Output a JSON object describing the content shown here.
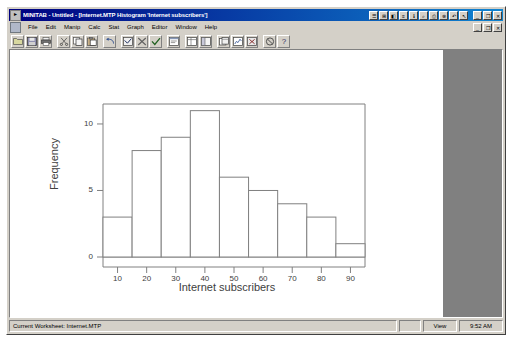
{
  "window": {
    "title": "MINITAB - Untitled - [Internet.MTP  Histogram 'Internet subscribers']",
    "app_icon": "minitab-icon",
    "control_minimize": "_",
    "control_restore": "❐",
    "control_close": "✕"
  },
  "menubar": {
    "doc_icon": "document-icon",
    "items": [
      {
        "label": "File"
      },
      {
        "label": "Edit"
      },
      {
        "label": "Manip"
      },
      {
        "label": "Calc"
      },
      {
        "label": "Stat"
      },
      {
        "label": "Graph"
      },
      {
        "label": "Editor"
      },
      {
        "label": "Window"
      },
      {
        "label": "Help"
      }
    ],
    "child_minimize": "_",
    "child_restore": "❐",
    "child_close": "✕"
  },
  "titlebar_buttons": [
    {
      "name": "session-window-button",
      "glyph": "☰"
    },
    {
      "name": "worksheet-window-button",
      "glyph": "⊞"
    },
    {
      "name": "graph-window-button",
      "glyph": "◧"
    },
    {
      "name": "history-window-button",
      "glyph": "≡"
    },
    {
      "name": "info-window-button",
      "glyph": "ℹ"
    },
    {
      "name": "find-button",
      "glyph": "⌕"
    },
    {
      "name": "print-button",
      "glyph": "⎙"
    },
    {
      "name": "cancel-button",
      "glyph": "⊗"
    },
    {
      "name": "undo-button",
      "glyph": "↶"
    },
    {
      "name": "help-arrow-button",
      "glyph": "↖"
    }
  ],
  "toolbar": {
    "buttons": [
      {
        "name": "open-worksheet-button",
        "icon": "folder-open-icon"
      },
      {
        "name": "save-project-button",
        "icon": "floppy-disk-icon"
      },
      {
        "name": "print-button",
        "icon": "printer-icon"
      },
      {
        "name": "cut-button",
        "icon": "scissors-icon"
      },
      {
        "name": "copy-button",
        "icon": "copy-icon"
      },
      {
        "name": "paste-button",
        "icon": "clipboard-icon"
      },
      {
        "name": "undo-button",
        "icon": "undo-arrow-icon"
      },
      {
        "name": "edit-last-dialog-button",
        "icon": "dialog-icon"
      },
      {
        "name": "cancel-button",
        "icon": "cancel-icon"
      },
      {
        "name": "check-button",
        "icon": "check-icon"
      },
      {
        "name": "session-window-button",
        "icon": "session-window-icon"
      },
      {
        "name": "current-data-window-button",
        "icon": "worksheet-icon"
      },
      {
        "name": "project-manager-button",
        "icon": "project-manager-icon"
      },
      {
        "name": "show-worksheets-button",
        "icon": "worksheets-icon"
      },
      {
        "name": "show-graphs-button",
        "icon": "graphs-icon"
      },
      {
        "name": "close-all-graphs-button",
        "icon": "close-graphs-icon"
      },
      {
        "name": "stop-button",
        "icon": "no-entry-icon"
      },
      {
        "name": "help-button",
        "icon": "question-mark-icon"
      }
    ]
  },
  "statusbar": {
    "worksheet_text": "Current Worksheet: Internet.MTP",
    "mode_text": "View",
    "time_text": "9:52 AM"
  },
  "chart_data": {
    "type": "bar",
    "title": "",
    "xlabel": "Internet subscribers",
    "ylabel": "Frequency",
    "categories": [
      "10",
      "20",
      "30",
      "40",
      "50",
      "60",
      "70",
      "80",
      "90"
    ],
    "values": [
      3,
      8,
      9,
      11,
      6,
      5,
      4,
      3,
      1
    ],
    "bin_edges": [
      5,
      15,
      25,
      35,
      45,
      55,
      65,
      75,
      85,
      95
    ],
    "ylim": [
      0,
      11.5
    ],
    "yticks": [
      0,
      5,
      10
    ],
    "xticks": [
      10,
      20,
      30,
      40,
      50,
      60,
      70,
      80,
      90
    ],
    "grid": false,
    "legend": false,
    "bar_fill": "#ffffff",
    "bar_edge": "#808080",
    "axis_color": "#808080",
    "text_color": "#404040"
  }
}
